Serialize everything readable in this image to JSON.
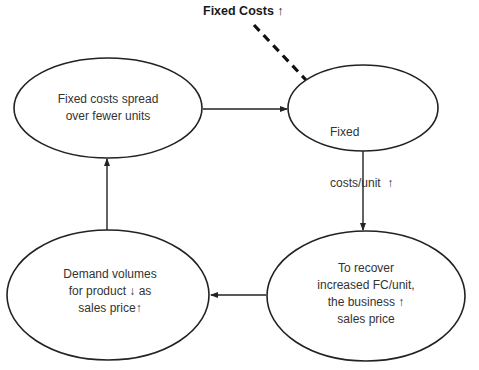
{
  "diagram": {
    "type": "cycle",
    "trigger": {
      "label": "Fixed Costs ↑"
    },
    "nodes": [
      {
        "id": "spread",
        "lines": [
          "Fixed costs spread",
          "over fewer units"
        ]
      },
      {
        "id": "fc_unit",
        "lines": [
          "Fixed",
          "costs/unit  ↑"
        ]
      },
      {
        "id": "recover",
        "lines": [
          "To recover",
          "increased FC/unit,",
          "the business ↑",
          "sales price"
        ]
      },
      {
        "id": "demand",
        "lines": [
          "Demand volumes",
          "for product ↓ as",
          "sales price↑"
        ]
      }
    ],
    "edges": [
      {
        "from": "trigger",
        "to": "fc_unit",
        "style": "dashed"
      },
      {
        "from": "spread",
        "to": "fc_unit",
        "style": "solid-arrow"
      },
      {
        "from": "fc_unit",
        "to": "recover",
        "style": "solid-arrow"
      },
      {
        "from": "recover",
        "to": "demand",
        "style": "solid-arrow"
      },
      {
        "from": "demand",
        "to": "spread",
        "style": "solid-arrow"
      }
    ],
    "colors": {
      "stroke": "#222222",
      "text": "#333333",
      "background": "#ffffff"
    }
  }
}
